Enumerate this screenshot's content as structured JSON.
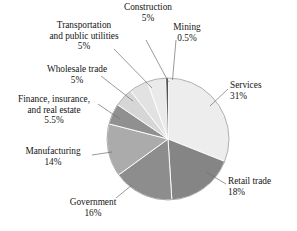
{
  "chart_data": {
    "type": "pie",
    "title": "",
    "subtitle": "",
    "xlabel": "",
    "ylabel": "",
    "legend_position": "none",
    "grid": false,
    "labels_outside": true,
    "start_angle_deg": 0,
    "direction": "clockwise",
    "categories": [
      "Services",
      "Retail trade",
      "Government",
      "Manufacturing",
      "Finance, insurance, and real estate",
      "Wholesale trade",
      "Transportation and public utilities",
      "Construction",
      "Mining"
    ],
    "values": [
      31,
      18,
      16,
      14,
      5.5,
      5,
      5,
      5,
      0.5
    ],
    "unit": "%",
    "slices": [
      {
        "name": "Services",
        "value": 31,
        "pct_text": "31%",
        "color": "#ededed"
      },
      {
        "name": "Retail trade",
        "value": 18,
        "pct_text": "18%",
        "color": "#858585"
      },
      {
        "name": "Government",
        "value": 16,
        "pct_text": "16%",
        "color": "#8d8d8d"
      },
      {
        "name": "Manufacturing",
        "value": 14,
        "pct_text": "14%",
        "color": "#ababab"
      },
      {
        "name": "Finance, insurance, and real estate",
        "value": 5.5,
        "pct_text": "5.5%",
        "color": "#909090"
      },
      {
        "name": "Wholesale trade",
        "value": 5,
        "pct_text": "5%",
        "color": "#d6d6d6"
      },
      {
        "name": "Transportation and public utilities",
        "value": 5,
        "pct_text": "5%",
        "color": "#e2e2e2"
      },
      {
        "name": "Construction",
        "value": 5,
        "pct_text": "5%",
        "color": "#eaeaea"
      },
      {
        "name": "Mining",
        "value": 0.5,
        "pct_text": "0.5%",
        "color": "#3a3a3a"
      }
    ]
  },
  "labels": {
    "construction": {
      "name": "Construction",
      "pct": "5%"
    },
    "mining": {
      "name": "Mining",
      "pct": "0.5%"
    },
    "transport_l1": "Transportation",
    "transport_l2": "and public utilities",
    "transport_pct": "5%",
    "wholesale": {
      "name": "Wholesale trade",
      "pct": "5%"
    },
    "finance_l1": "Finance, insurance,",
    "finance_l2": "and real estate",
    "finance_pct": "5.5%",
    "manufacturing": {
      "name": "Manufacturing",
      "pct": "14%"
    },
    "government": {
      "name": "Government",
      "pct": "16%"
    },
    "services": {
      "name": "Services",
      "pct": "31%"
    },
    "retail": {
      "name": "Retail trade",
      "pct": "18%"
    }
  },
  "style": {
    "background": "#ffffff",
    "text_color": "#141414",
    "leader_line_color": "#6e6e6e",
    "slice_separator": "#ffffff",
    "pie_outline": "#9a9a9a"
  }
}
